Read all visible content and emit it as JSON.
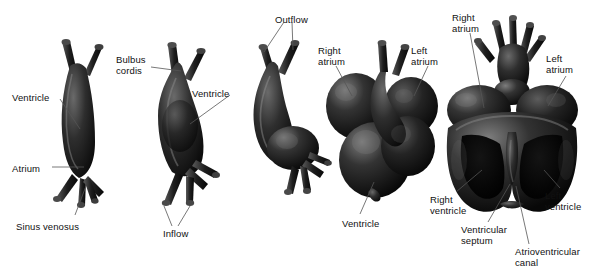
{
  "figure": {
    "background_color": "#ffffff",
    "specimen_color": "#1a1a1a",
    "label_color": "#111111",
    "leader_color": "#555555"
  },
  "stages": [
    {
      "id": "stage-1",
      "name": "straight-heart-tube",
      "labels": [
        {
          "key": "ventricle",
          "text": "Ventricle",
          "x": 12,
          "y": 92
        },
        {
          "key": "atrium",
          "text": "Atrium",
          "x": 12,
          "y": 163
        },
        {
          "key": "sinus_venosus",
          "text": "Sinus venosus",
          "x": 16,
          "y": 221
        }
      ]
    },
    {
      "id": "stage-2",
      "name": "looping-heart-tube",
      "labels": [
        {
          "key": "bulbus_cordis_line1",
          "text": "Bulbus",
          "x": 116,
          "y": 54
        },
        {
          "key": "bulbus_cordis_line2",
          "text": "cordis",
          "x": 116,
          "y": 65
        },
        {
          "key": "ventricle",
          "text": "Ventricle",
          "x": 192,
          "y": 88
        },
        {
          "key": "inflow",
          "text": "Inflow",
          "x": 163,
          "y": 228
        }
      ]
    },
    {
      "id": "stage-3",
      "name": "looped-heart-tube",
      "labels": [
        {
          "key": "outflow",
          "text": "Outflow",
          "x": 275,
          "y": 14
        }
      ]
    },
    {
      "id": "stage-4",
      "name": "chambered-heart-exterior",
      "labels": [
        {
          "key": "right_atrium_line1",
          "text": "Right",
          "x": 318,
          "y": 45
        },
        {
          "key": "right_atrium_line2",
          "text": "atrium",
          "x": 318,
          "y": 56
        },
        {
          "key": "left_atrium_line1",
          "text": "Left",
          "x": 411,
          "y": 45
        },
        {
          "key": "left_atrium_line2",
          "text": "atrium",
          "x": 411,
          "y": 56
        },
        {
          "key": "ventricle",
          "text": "Ventricle",
          "x": 342,
          "y": 218
        }
      ]
    },
    {
      "id": "stage-5",
      "name": "septated-heart-dissected",
      "labels": [
        {
          "key": "right_atrium_line1",
          "text": "Right",
          "x": 452,
          "y": 12
        },
        {
          "key": "right_atrium_line2",
          "text": "atrium",
          "x": 452,
          "y": 23
        },
        {
          "key": "left_atrium_line1",
          "text": "Left",
          "x": 546,
          "y": 53
        },
        {
          "key": "left_atrium_line2",
          "text": "atrium",
          "x": 546,
          "y": 64
        },
        {
          "key": "right_ventricle_line1",
          "text": "Right",
          "x": 430,
          "y": 194
        },
        {
          "key": "right_ventricle_line2",
          "text": "ventricle",
          "x": 430,
          "y": 205
        },
        {
          "key": "left_ventricle_line1",
          "text": "Left",
          "x": 545,
          "y": 190
        },
        {
          "key": "left_ventricle_line2",
          "text": "ventricle",
          "x": 545,
          "y": 201
        },
        {
          "key": "ventricular_septum_line1",
          "text": "Ventricular",
          "x": 461,
          "y": 224
        },
        {
          "key": "ventricular_septum_line2",
          "text": "septum",
          "x": 461,
          "y": 235
        },
        {
          "key": "atrioventricular_canal_line1",
          "text": "Atrioventricular",
          "x": 515,
          "y": 246
        },
        {
          "key": "atrioventricular_canal_line2",
          "text": "canal",
          "x": 515,
          "y": 257
        }
      ]
    }
  ]
}
